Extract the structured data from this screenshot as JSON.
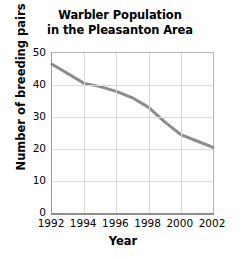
{
  "chart_data": {
    "type": "line",
    "title": "Warbler Population in the Pleasanton Area",
    "title_lines": [
      "Warbler Population",
      "in the Pleasanton Area"
    ],
    "xlabel": "Year",
    "ylabel": "Number of breeding pairs",
    "xlim": [
      1992,
      2002
    ],
    "ylim": [
      0,
      50
    ],
    "xticks": [
      1992,
      1994,
      1996,
      1998,
      2000,
      2002
    ],
    "yticks": [
      0,
      10,
      20,
      30,
      40,
      50
    ],
    "grid": true,
    "legend": null,
    "legend_position": "none",
    "line_color": "#8c8c8c",
    "line_width": 3,
    "x": [
      1992,
      1993,
      1994,
      1995,
      1996,
      1997,
      1998,
      1999,
      2000,
      2001,
      2002
    ],
    "values": [
      46.5,
      43.5,
      40.5,
      39.5,
      38,
      36,
      33,
      28.5,
      24.5,
      22.5,
      20.5
    ],
    "series": [
      {
        "name": "Number of breeding pairs",
        "values": [
          46.5,
          43.5,
          40.5,
          39.5,
          38,
          36,
          33,
          28.5,
          24.5,
          22.5,
          20.5
        ]
      }
    ]
  }
}
